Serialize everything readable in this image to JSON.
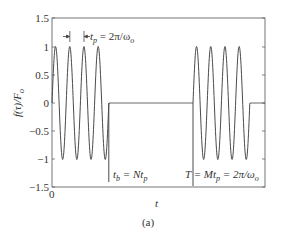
{
  "chart_data": {
    "type": "line",
    "title": "",
    "caption": "(a)",
    "xlabel": "t",
    "ylabel": "f(τ)/F_o",
    "ylim": [
      -1.5,
      1.5
    ],
    "yticks": [
      "1.5",
      "1",
      "0.5",
      "0",
      "-0.5",
      "-1",
      "-1.5"
    ],
    "xticks": [
      "0"
    ],
    "grid": false,
    "series": [
      {
        "name": "tone burst",
        "description": "Sinusoidal burst of N=4 cycles of amplitude 1 starting at t=0, zero until T, then another 4-cycle burst starting at T",
        "cycles_per_burst": 4,
        "amplitude": 1,
        "burst_starts_px": [
          52,
          193
        ],
        "period_px": 14.2
      }
    ],
    "annotations": {
      "tp": "t_p = 2π/ω_o",
      "tb": "t_b = Nt_p",
      "T": "T = Mt_p = 2π/ω_o"
    }
  },
  "axes": {
    "xlabel": "t",
    "ylabel_main": "f(τ)/F",
    "ylabel_sub": "o",
    "caption": "(a)",
    "xtick0": "0",
    "yticks": [
      {
        "label": "1.5",
        "y": 18
      },
      {
        "label": "1",
        "y": 47
      },
      {
        "label": "0.5",
        "y": 75
      },
      {
        "label": "0",
        "y": 103
      },
      {
        "label": "−0.5",
        "y": 131
      },
      {
        "label": "−1",
        "y": 159
      },
      {
        "label": "−1.5",
        "y": 187
      }
    ]
  },
  "labels": {
    "tp_main": "t",
    "tp_sub": "p",
    "tp_rest": " = 2π/ω",
    "tp_sub2": "o",
    "tb_main": "t",
    "tb_sub": "b",
    "tb_mid": " = Nt",
    "tb_sub2": "p",
    "T_main": "T = Mt",
    "T_sub": "p",
    "T_rest": " = 2π/ω",
    "T_sub2": "o"
  },
  "colors": {
    "line": "#4a4a4a",
    "axis": "#555555"
  }
}
